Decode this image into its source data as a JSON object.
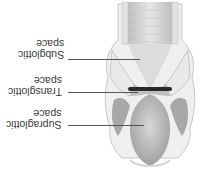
{
  "figure": {
    "orientation": "rotated-180",
    "labels": [
      {
        "line1": "Subglottic",
        "line2": "space"
      },
      {
        "line1": "Transglottic",
        "line2": "space"
      },
      {
        "line1": "Supraglottic",
        "line2": "space"
      }
    ]
  },
  "colors": {
    "background": "#ffffff",
    "tissue_light": "#ececec",
    "tissue_mid": "#c9c9c9",
    "tissue_dark": "#9a9a9a",
    "glottis_bar": "#2a2a2a",
    "text": "#3a3a3a"
  }
}
